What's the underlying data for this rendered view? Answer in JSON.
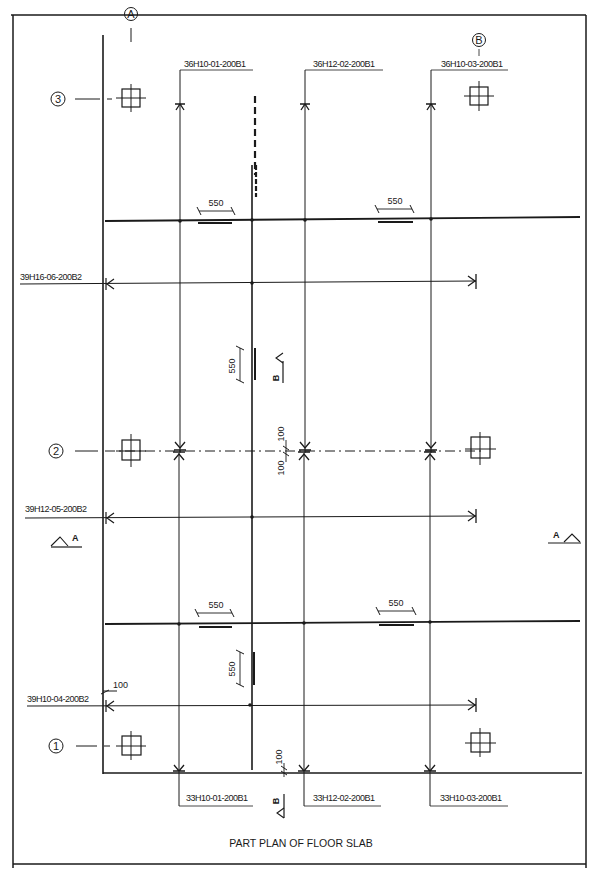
{
  "drawing": {
    "title": "PART PLAN OF FLOOR SLAB",
    "grid_columns": [
      {
        "label": "A"
      },
      {
        "label": "B"
      }
    ],
    "grid_rows": [
      {
        "label": "3"
      },
      {
        "label": "2"
      },
      {
        "label": "1"
      }
    ],
    "top_bar_marks": [
      "36H10-01-200B1",
      "36H12-02-200B1",
      "36H10-03-200B1"
    ],
    "bottom_bar_marks": [
      "33H10-01-200B1",
      "33H12-02-200B1",
      "33H10-03-200B1"
    ],
    "left_bar_marks": [
      "39H16-06-200B2",
      "39H12-05-200B2",
      "39H10-04-200B2"
    ],
    "dimensions": {
      "lap_top_left": "550",
      "lap_top_right": "550",
      "lap_vertical_upper": "550",
      "lap_bottom_left": "550",
      "lap_bottom_right": "550",
      "lap_vertical_lower": "550",
      "cover_row2_top": "100",
      "cover_row2_bottom": "100",
      "cover_left": "100",
      "cover_bottom": "100"
    },
    "section_marks": {
      "section_a_left": "A",
      "section_a_right": "A",
      "section_b_upper": "B",
      "section_b_lower": "B"
    }
  }
}
